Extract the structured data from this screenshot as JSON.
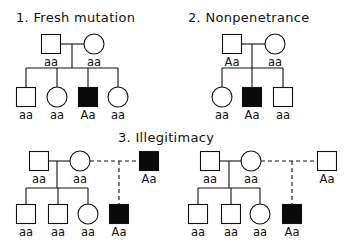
{
  "figure": {
    "colors": {
      "ink": "#111111",
      "affected": "#0a0a0a",
      "background": "#ffffff"
    },
    "panels": [
      {
        "id": "fresh-mutation",
        "title": "1. Fresh mutation",
        "title_pos": [
          16,
          22
        ],
        "individuals": [
          {
            "id": "p1-father",
            "sex": "male",
            "affected": false,
            "genotype": "aa",
            "x": 51,
            "y": 44
          },
          {
            "id": "p1-mother",
            "sex": "female",
            "affected": false,
            "genotype": "aa",
            "x": 94,
            "y": 44
          },
          {
            "id": "p1-child1",
            "sex": "male",
            "affected": false,
            "genotype": "aa",
            "x": 26,
            "y": 97
          },
          {
            "id": "p1-child2",
            "sex": "female",
            "affected": false,
            "genotype": "aa",
            "x": 57,
            "y": 97
          },
          {
            "id": "p1-child3",
            "sex": "male",
            "affected": true,
            "genotype": "Aa",
            "x": 88,
            "y": 97
          },
          {
            "id": "p1-child4",
            "sex": "female",
            "affected": false,
            "genotype": "aa",
            "x": 118,
            "y": 97
          }
        ],
        "lines": [
          {
            "x1": 61,
            "y1": 44,
            "x2": 84,
            "y2": 44,
            "dashed": false
          },
          {
            "x1": 72,
            "y1": 44,
            "x2": 72,
            "y2": 68,
            "dashed": false
          },
          {
            "x1": 26,
            "y1": 68,
            "x2": 118,
            "y2": 68,
            "dashed": false
          },
          {
            "x1": 26,
            "y1": 68,
            "x2": 26,
            "y2": 87,
            "dashed": false
          },
          {
            "x1": 57,
            "y1": 68,
            "x2": 57,
            "y2": 87,
            "dashed": false
          },
          {
            "x1": 88,
            "y1": 68,
            "x2": 88,
            "y2": 87,
            "dashed": false
          },
          {
            "x1": 118,
            "y1": 68,
            "x2": 118,
            "y2": 87,
            "dashed": false
          }
        ]
      },
      {
        "id": "nonpenetrance",
        "title": "2. Nonpenetrance",
        "title_pos": [
          188,
          22
        ],
        "individuals": [
          {
            "id": "p2-father",
            "sex": "male",
            "affected": false,
            "genotype": "Aa",
            "x": 232,
            "y": 44
          },
          {
            "id": "p2-mother",
            "sex": "female",
            "affected": false,
            "genotype": "aa",
            "x": 275,
            "y": 44
          },
          {
            "id": "p2-child1",
            "sex": "female",
            "affected": false,
            "genotype": "aa",
            "x": 222,
            "y": 97
          },
          {
            "id": "p2-child2",
            "sex": "male",
            "affected": true,
            "genotype": "Aa",
            "x": 252,
            "y": 97
          },
          {
            "id": "p2-child3",
            "sex": "male",
            "affected": false,
            "genotype": "aa",
            "x": 283,
            "y": 97
          }
        ],
        "lines": [
          {
            "x1": 242,
            "y1": 44,
            "x2": 265,
            "y2": 44,
            "dashed": false
          },
          {
            "x1": 252,
            "y1": 44,
            "x2": 252,
            "y2": 68,
            "dashed": false
          },
          {
            "x1": 222,
            "y1": 68,
            "x2": 283,
            "y2": 68,
            "dashed": false
          },
          {
            "x1": 222,
            "y1": 68,
            "x2": 222,
            "y2": 87,
            "dashed": false
          },
          {
            "x1": 252,
            "y1": 68,
            "x2": 252,
            "y2": 87,
            "dashed": false
          },
          {
            "x1": 283,
            "y1": 68,
            "x2": 283,
            "y2": 87,
            "dashed": false
          }
        ]
      },
      {
        "id": "illegitimacy",
        "title": "3. Illegitimacy",
        "title_pos": [
          118,
          142
        ],
        "individuals": [
          {
            "id": "p3a-father",
            "sex": "male",
            "affected": false,
            "genotype": "aa",
            "x": 39,
            "y": 161
          },
          {
            "id": "p3a-mother",
            "sex": "female",
            "affected": false,
            "genotype": "aa",
            "x": 80,
            "y": 161
          },
          {
            "id": "p3a-true-father",
            "sex": "male",
            "affected": true,
            "genotype": "Aa",
            "x": 149,
            "y": 161
          },
          {
            "id": "p3a-child1",
            "sex": "male",
            "affected": false,
            "genotype": "aa",
            "x": 26,
            "y": 214
          },
          {
            "id": "p3a-child2",
            "sex": "male",
            "affected": false,
            "genotype": "aa",
            "x": 58,
            "y": 214
          },
          {
            "id": "p3a-child3",
            "sex": "female",
            "affected": false,
            "genotype": "aa",
            "x": 88,
            "y": 214
          },
          {
            "id": "p3a-child4",
            "sex": "male",
            "affected": true,
            "genotype": "Aa",
            "x": 119,
            "y": 214
          },
          {
            "id": "p3b-father",
            "sex": "male",
            "affected": false,
            "genotype": "aa",
            "x": 210,
            "y": 161
          },
          {
            "id": "p3b-mother",
            "sex": "female",
            "affected": false,
            "genotype": "aa",
            "x": 251,
            "y": 161
          },
          {
            "id": "p3b-true-father",
            "sex": "male",
            "affected": false,
            "genotype": "Aa",
            "x": 327,
            "y": 161
          },
          {
            "id": "p3b-child1",
            "sex": "male",
            "affected": false,
            "genotype": "aa",
            "x": 198,
            "y": 214
          },
          {
            "id": "p3b-child2",
            "sex": "male",
            "affected": false,
            "genotype": "aa",
            "x": 231,
            "y": 214
          },
          {
            "id": "p3b-child3",
            "sex": "female",
            "affected": false,
            "genotype": "aa",
            "x": 260,
            "y": 214
          },
          {
            "id": "p3b-child4",
            "sex": "male",
            "affected": true,
            "genotype": "Aa",
            "x": 292,
            "y": 214
          }
        ],
        "lines": [
          {
            "x1": 49,
            "y1": 161,
            "x2": 70,
            "y2": 161,
            "dashed": false
          },
          {
            "x1": 57,
            "y1": 161,
            "x2": 57,
            "y2": 188,
            "dashed": false
          },
          {
            "x1": 26,
            "y1": 188,
            "x2": 88,
            "y2": 188,
            "dashed": false
          },
          {
            "x1": 26,
            "y1": 188,
            "x2": 26,
            "y2": 205,
            "dashed": false
          },
          {
            "x1": 58,
            "y1": 188,
            "x2": 58,
            "y2": 205,
            "dashed": false
          },
          {
            "x1": 88,
            "y1": 188,
            "x2": 88,
            "y2": 204,
            "dashed": false
          },
          {
            "x1": 90,
            "y1": 161,
            "x2": 140,
            "y2": 161,
            "dashed": true
          },
          {
            "x1": 119,
            "y1": 161,
            "x2": 119,
            "y2": 205,
            "dashed": true
          },
          {
            "x1": 220,
            "y1": 161,
            "x2": 241,
            "y2": 161,
            "dashed": false
          },
          {
            "x1": 229,
            "y1": 161,
            "x2": 229,
            "y2": 188,
            "dashed": false
          },
          {
            "x1": 198,
            "y1": 188,
            "x2": 260,
            "y2": 188,
            "dashed": false
          },
          {
            "x1": 198,
            "y1": 188,
            "x2": 198,
            "y2": 205,
            "dashed": false
          },
          {
            "x1": 231,
            "y1": 188,
            "x2": 231,
            "y2": 205,
            "dashed": false
          },
          {
            "x1": 260,
            "y1": 188,
            "x2": 260,
            "y2": 204,
            "dashed": false
          },
          {
            "x1": 261,
            "y1": 161,
            "x2": 318,
            "y2": 161,
            "dashed": true
          },
          {
            "x1": 292,
            "y1": 161,
            "x2": 292,
            "y2": 205,
            "dashed": true
          }
        ]
      }
    ]
  }
}
